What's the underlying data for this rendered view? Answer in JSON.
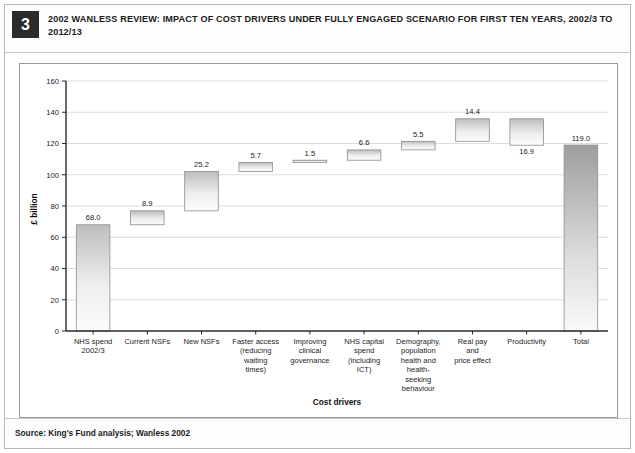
{
  "header": {
    "badge_number": "3",
    "title": "2002 WANLESS REVIEW: IMPACT OF COST DRIVERS UNDER FULLY ENGAGED SCENARIO FOR FIRST TEN YEARS, 2002/3 TO 2012/13"
  },
  "source": {
    "text": "Source: King's Fund analysis; Wanless 2002"
  },
  "colors": {
    "badge_background": "#2b2b2b",
    "badge_text": "#ffffff",
    "frame_border": "#b8b8b8",
    "chart_border": "#9a9a9a",
    "axis": "#2a2a2a",
    "gridline": "#cfcfcf",
    "bar_fill_light": "#fcfcfc",
    "bar_fill_dark": "#bdbdbd",
    "bar_stroke": "#8d8d8d",
    "total_fill_dark": "#9e9e9e",
    "total_fill_light": "#f7f7f7"
  },
  "chart_data": {
    "type": "bar",
    "subtype": "waterfall",
    "title": "2002 Wanless Review: impact of cost drivers under fully engaged scenario for first ten years, 2002/3 to 2012/13",
    "xlabel": "Cost drivers",
    "ylabel": "£ billion",
    "ylim": [
      0,
      160
    ],
    "ytick_values": [
      0,
      20,
      40,
      60,
      80,
      100,
      120,
      140,
      160
    ],
    "ytick_labels": [
      "0",
      "20",
      "40",
      "60",
      "80",
      "100",
      "120",
      "140",
      "160"
    ],
    "grid": true,
    "legend": false,
    "categories": [
      "NHS spend 2002/3",
      "Current NSFs",
      "New NSFs",
      "Faster access (reducing waiting times)",
      "Improving clinical governance",
      "NHS capital spend (including ICT)",
      "Demography, population health and health-seeking behaviour",
      "Real pay and price effect",
      "Productivity",
      "Total"
    ],
    "category_lines": [
      [
        "NHS spend",
        "2002/3"
      ],
      [
        "Current NSFs"
      ],
      [
        "New NSFs"
      ],
      [
        "Faster access",
        "(reducing",
        "waiting",
        "times)"
      ],
      [
        "Improving",
        "clinical",
        "governance"
      ],
      [
        "NHS capital",
        "spend",
        "(including",
        "ICT)"
      ],
      [
        "Demography,",
        "population",
        "health and",
        "health-",
        "seeking",
        "behaviour"
      ],
      [
        "Real pay",
        "and",
        "price effect"
      ],
      [
        "Productivity"
      ],
      [
        "Total"
      ]
    ],
    "values": [
      68.0,
      8.9,
      25.2,
      5.7,
      1.5,
      6.6,
      5.5,
      14.4,
      -16.9,
      119.0
    ],
    "value_labels": [
      "68.0",
      "8.9",
      "25.2",
      "5.7",
      "1.5",
      "6.6",
      "5.5",
      "14.4",
      "16.9",
      "119.0"
    ],
    "bars": [
      {
        "category": "NHS spend 2002/3",
        "label": "68.0",
        "value": 68.0,
        "base": 0.0,
        "top": 68.0,
        "kind": "total",
        "label_position": "above"
      },
      {
        "category": "Current NSFs",
        "label": "8.9",
        "value": 8.9,
        "base": 68.0,
        "top": 76.9,
        "kind": "increase",
        "label_position": "above"
      },
      {
        "category": "New NSFs",
        "label": "25.2",
        "value": 25.2,
        "base": 76.9,
        "top": 102.1,
        "kind": "increase",
        "label_position": "above"
      },
      {
        "category": "Faster access (reducing waiting times)",
        "label": "5.7",
        "value": 5.7,
        "base": 102.1,
        "top": 107.8,
        "kind": "increase",
        "label_position": "above"
      },
      {
        "category": "Improving clinical governance",
        "label": "1.5",
        "value": 1.5,
        "base": 107.8,
        "top": 109.3,
        "kind": "increase",
        "label_position": "above"
      },
      {
        "category": "NHS capital spend (including ICT)",
        "label": "6.6",
        "value": 6.6,
        "base": 109.3,
        "top": 115.9,
        "kind": "increase",
        "label_position": "above"
      },
      {
        "category": "Demography, population health and health-seeking behaviour",
        "label": "5.5",
        "value": 5.5,
        "base": 115.9,
        "top": 121.4,
        "kind": "increase",
        "label_position": "above"
      },
      {
        "category": "Real pay and price effect",
        "label": "14.4",
        "value": 14.4,
        "base": 121.4,
        "top": 135.8,
        "kind": "increase",
        "label_position": "above"
      },
      {
        "category": "Productivity",
        "label": "16.9",
        "value": -16.9,
        "base": 118.9,
        "top": 135.8,
        "kind": "decrease",
        "label_position": "below"
      },
      {
        "category": "Total",
        "label": "119.0",
        "value": 119.0,
        "base": 0.0,
        "top": 119.0,
        "kind": "total",
        "label_position": "above"
      }
    ]
  }
}
